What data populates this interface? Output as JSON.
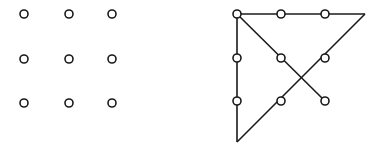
{
  "figure": {
    "background_color": "#ffffff",
    "canvas": {
      "width": 386,
      "height": 152
    }
  },
  "style": {
    "dot_stroke_color": "#1a1a1a",
    "dot_fill_color": "#ffffff",
    "dot_radius": 4.0,
    "dot_stroke_width": 1.6,
    "line_color": "#1a1a1a",
    "line_width": 1.6
  },
  "panels": [
    {
      "id": "left-panel",
      "name": "nine-dots-grid",
      "label": "",
      "rows": 3,
      "columns": 3,
      "column_x": [
        24,
        69,
        112
      ],
      "row_y": [
        14,
        59,
        103
      ],
      "dots": [
        {
          "id": "L-r1c1",
          "label": "",
          "x": 24,
          "y": 14
        },
        {
          "id": "L-r1c2",
          "label": "",
          "x": 69,
          "y": 14
        },
        {
          "id": "L-r1c3",
          "label": "",
          "x": 112,
          "y": 14
        },
        {
          "id": "L-r2c1",
          "label": "",
          "x": 24,
          "y": 59
        },
        {
          "id": "L-r2c2",
          "label": "",
          "x": 69,
          "y": 59
        },
        {
          "id": "L-r2c3",
          "label": "",
          "x": 112,
          "y": 59
        },
        {
          "id": "L-r3c1",
          "label": "",
          "x": 24,
          "y": 103
        },
        {
          "id": "L-r3c2",
          "label": "",
          "x": 69,
          "y": 103
        },
        {
          "id": "L-r3c3",
          "label": "",
          "x": 112,
          "y": 103
        }
      ],
      "lines": []
    },
    {
      "id": "right-panel",
      "name": "nine-dots-solution",
      "label": "",
      "rows": 3,
      "columns": 3,
      "column_x": [
        237,
        281,
        325
      ],
      "row_y": [
        14,
        58,
        101
      ],
      "dots": [
        {
          "id": "R-r1c1",
          "label": "",
          "x": 237,
          "y": 14
        },
        {
          "id": "R-r1c2",
          "label": "",
          "x": 281,
          "y": 14
        },
        {
          "id": "R-r1c3",
          "label": "",
          "x": 325,
          "y": 14
        },
        {
          "id": "R-r2c1",
          "label": "",
          "x": 237,
          "y": 58
        },
        {
          "id": "R-r2c2",
          "label": "",
          "x": 281,
          "y": 58
        },
        {
          "id": "R-r2c3",
          "label": "",
          "x": 325,
          "y": 58
        },
        {
          "id": "R-r3c1",
          "label": "",
          "x": 237,
          "y": 101
        },
        {
          "id": "R-r3c2",
          "label": "",
          "x": 281,
          "y": 101
        },
        {
          "id": "R-r3c3",
          "label": "",
          "x": 325,
          "y": 101
        }
      ],
      "outside_vertices": [
        {
          "id": "V-bottom",
          "label": "",
          "x": 237,
          "y": 142
        },
        {
          "id": "V-topright",
          "label": "",
          "x": 365,
          "y": 14
        }
      ],
      "lines": [
        {
          "id": "seg-1-left-vertical",
          "name": "left-vertical-segment",
          "from": [
            237,
            142
          ],
          "to": [
            237,
            14
          ],
          "points": "237,142 237,14"
        },
        {
          "id": "seg-2-top-horizontal",
          "name": "top-horizontal-segment",
          "from": [
            237,
            14
          ],
          "to": [
            365,
            14
          ],
          "points": "237,14 365,14"
        },
        {
          "id": "seg-3-diagonal-down-left",
          "name": "diagonal-down-left-segment",
          "from": [
            365,
            14
          ],
          "to": [
            237,
            142
          ],
          "points": "365,14 237,142"
        },
        {
          "id": "seg-4-diagonal-down-right",
          "name": "diagonal-down-right-segment",
          "from": [
            237,
            14
          ],
          "to": [
            325,
            101
          ],
          "points": "237,14 325,101"
        }
      ],
      "line_path": "237,142 237,14 365,14 237,142"
    }
  ]
}
